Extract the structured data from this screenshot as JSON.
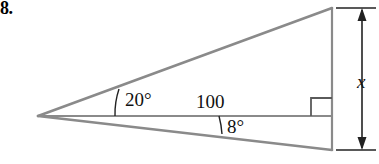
{
  "figure": {
    "problem_number": "8.",
    "labels": {
      "angle_upper": "20°",
      "angle_lower": "8°",
      "base_length": "100",
      "vertical_length": "x"
    },
    "colors": {
      "stroke": "#8a8a8a",
      "stroke_dark": "#333333",
      "text": "#111111",
      "background": "#ffffff"
    },
    "geometry": {
      "apex": [
        38,
        116
      ],
      "top_vertex": [
        332,
        8
      ],
      "bottom_vertex": [
        332,
        150
      ],
      "base_right": [
        332,
        116
      ],
      "upper_angle_degrees": 20,
      "lower_angle_degrees": 8,
      "right_angle_marker": true,
      "dimension_line_x": 362,
      "dimension_top_y": 8,
      "dimension_bottom_y": 150
    }
  }
}
